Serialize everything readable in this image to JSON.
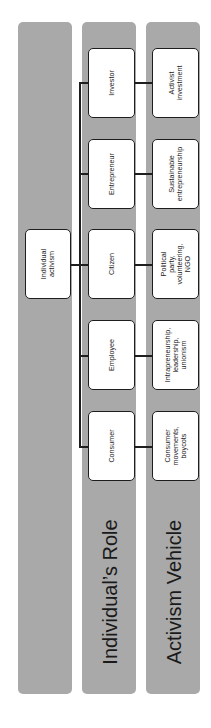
{
  "diagram": {
    "type": "hierarchy",
    "orientation": "rotated-90-ccw",
    "colors": {
      "band": "#a9a9a9",
      "box_fill": "#ffffff",
      "box_border": "#1e1e1e",
      "connector": "#1e1e1e"
    },
    "root": {
      "label": "Individual\nactivism"
    },
    "bands": [
      {
        "label": ""
      },
      {
        "label": "Individual’s Role"
      },
      {
        "label": "Activism Vehicle"
      }
    ],
    "roles": [
      {
        "label": "Investor"
      },
      {
        "label": "Entrepreneur"
      },
      {
        "label": "Citizen"
      },
      {
        "label": "Employee"
      },
      {
        "label": "Consumer"
      }
    ],
    "vehicles": [
      {
        "label": "Activist\ninvestment"
      },
      {
        "label": "Sustainable\nentrepreneurship"
      },
      {
        "label": "Political party,\nvolunteering,\nNGO"
      },
      {
        "label": "Intrapreneurship,\nleadership,\nunionism"
      },
      {
        "label": "Consumer\nmovements,\nboycots"
      }
    ]
  }
}
